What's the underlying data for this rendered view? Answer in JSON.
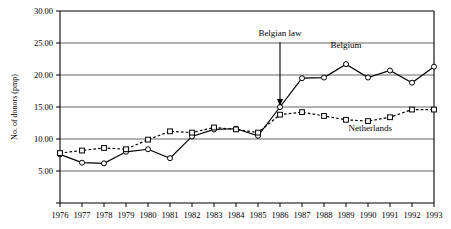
{
  "chart_data": {
    "type": "line",
    "title": "",
    "xlabel": "",
    "ylabel": "No. of donors (pmp)",
    "ylim": [
      0,
      30
    ],
    "xlim": [
      1976,
      1993
    ],
    "grid": true,
    "legend_position": "inline-labels",
    "categories": [
      1976,
      1977,
      1978,
      1979,
      1980,
      1981,
      1982,
      1983,
      1984,
      1985,
      1986,
      1987,
      1988,
      1989,
      1990,
      1991,
      1992,
      1993
    ],
    "x_tick_labels": [
      "1976",
      "1977",
      "1978",
      "1979",
      "1980",
      "1981",
      "1982",
      "1983",
      "1984",
      "1985",
      "1986",
      "1987",
      "1988",
      "1989",
      "1990",
      "1991",
      "1992",
      "1993"
    ],
    "y_tick_labels": [
      "30.00",
      "25.00",
      "20.00",
      "15.00",
      "10.00",
      "5.00",
      ""
    ],
    "y_tick_values": [
      30,
      25,
      20,
      15,
      10,
      5,
      0
    ],
    "series": [
      {
        "name": "Belgium",
        "marker": "circle",
        "line_style": "solid",
        "values": [
          7.6,
          6.3,
          6.2,
          8.0,
          8.4,
          7.0,
          10.4,
          11.5,
          11.6,
          10.5,
          15.0,
          19.5,
          19.6,
          21.7,
          19.6,
          20.7,
          18.8,
          21.3
        ]
      },
      {
        "name": "Netherlands",
        "marker": "square",
        "line_style": "dotted",
        "values": [
          7.8,
          8.2,
          8.6,
          8.4,
          9.9,
          11.2,
          11.0,
          11.8,
          11.5,
          11.0,
          13.8,
          14.2,
          13.6,
          13.0,
          12.8,
          13.4,
          14.6,
          14.6
        ]
      }
    ],
    "annotations": [
      {
        "text": "Belgian law",
        "x": 1986,
        "y": 15.0,
        "style": "arrow-down"
      }
    ],
    "series_labels": [
      {
        "text": "Belgium",
        "x": 1989,
        "y": 24.2
      },
      {
        "text": "Netherlands",
        "x": 1990.1,
        "y": 11.2
      }
    ]
  },
  "colors": {
    "axis": "#000000",
    "grid": "#555555",
    "series_belgium": "#000000",
    "series_netherlands": "#000000",
    "background": "#ffffff",
    "marker_fill": "#ffffff"
  }
}
